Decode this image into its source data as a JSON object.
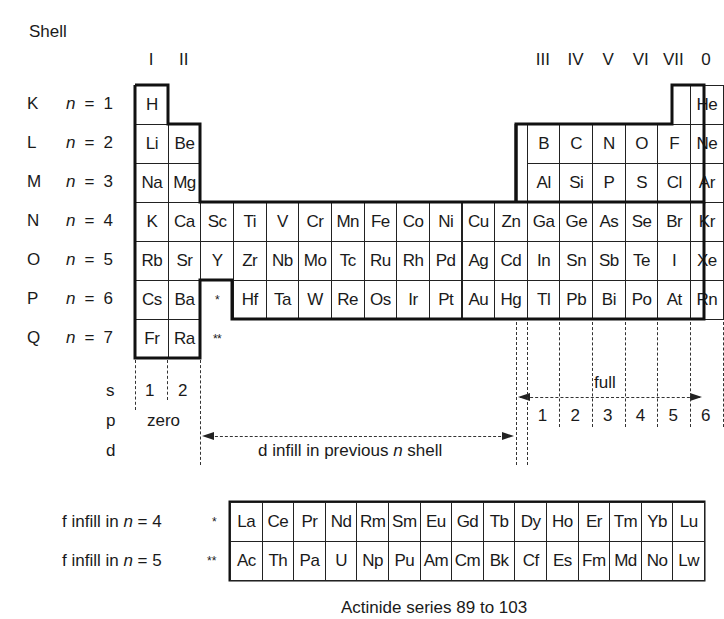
{
  "title": "Shell",
  "groups": [
    {
      "label": "I",
      "col": 0
    },
    {
      "label": "II",
      "col": 1
    },
    {
      "label": "III",
      "col": 12
    },
    {
      "label": "IV",
      "col": 13
    },
    {
      "label": "V",
      "col": 14
    },
    {
      "label": "VI",
      "col": 15
    },
    {
      "label": "VII",
      "col": 16
    },
    {
      "label": "0",
      "col": 17
    }
  ],
  "shells": [
    {
      "letter": "K",
      "n": "1"
    },
    {
      "letter": "L",
      "n": "2"
    },
    {
      "letter": "M",
      "n": "3"
    },
    {
      "letter": "N",
      "n": "4"
    },
    {
      "letter": "O",
      "n": "5"
    },
    {
      "letter": "P",
      "n": "6"
    },
    {
      "letter": "Q",
      "n": "7"
    }
  ],
  "n_prefix": "n",
  "n_equals": "=",
  "main_table": [
    [
      "H",
      "",
      "",
      "",
      "",
      "",
      "",
      "",
      "",
      "",
      "",
      "",
      "",
      "",
      "",
      "",
      "",
      "He"
    ],
    [
      "Li",
      "Be",
      "",
      "",
      "",
      "",
      "",
      "",
      "",
      "",
      "",
      "",
      "B",
      "C",
      "N",
      "O",
      "F",
      "Ne"
    ],
    [
      "Na",
      "Mg",
      "",
      "",
      "",
      "",
      "",
      "",
      "",
      "",
      "",
      "",
      "Al",
      "Si",
      "P",
      "S",
      "Cl",
      "Ar"
    ],
    [
      "K",
      "Ca",
      "Sc",
      "Ti",
      "V",
      "Cr",
      "Mn",
      "Fe",
      "Co",
      "Ni",
      "Cu",
      "Zn",
      "Ga",
      "Ge",
      "As",
      "Se",
      "Br",
      "Kr"
    ],
    [
      "Rb",
      "Sr",
      "Y",
      "Zr",
      "Nb",
      "Mo",
      "Tc",
      "Ru",
      "Rh",
      "Pd",
      "Ag",
      "Cd",
      "In",
      "Sn",
      "Sb",
      "Te",
      "I",
      "Xe"
    ],
    [
      "Cs",
      "Ba",
      "*",
      "Hf",
      "Ta",
      "W",
      "Re",
      "Os",
      "Ir",
      "Pt",
      "Au",
      "Hg",
      "Tl",
      "Pb",
      "Bi",
      "Po",
      "At",
      "Rn"
    ],
    [
      "Fr",
      "Ra",
      "**",
      "",
      "",
      "",
      "",
      "",
      "",
      "",
      "",
      "",
      "",
      "",
      "",
      "",
      "",
      ""
    ]
  ],
  "orbitals": {
    "s_label": "s",
    "p_label": "p",
    "d_label": "d",
    "s_numbers": [
      "1",
      "2"
    ],
    "s_zero": "zero",
    "d_text_pre": "d infill in previous ",
    "d_text_n": "n",
    "d_text_post": " shell",
    "p_full": "full",
    "p_numbers": [
      "1",
      "2",
      "3",
      "4",
      "5",
      "6"
    ]
  },
  "f_block": {
    "rows": [
      {
        "label_pre": "f infill in ",
        "label_n": "n",
        "label_post": " = 4",
        "marker": "*",
        "elements": [
          "La",
          "Ce",
          "Pr",
          "Nd",
          "Rm",
          "Sm",
          "Eu",
          "Gd",
          "Tb",
          "Dy",
          "Ho",
          "Er",
          "Tm",
          "Yb",
          "Lu"
        ]
      },
      {
        "label_pre": "f infill in ",
        "label_n": "n",
        "label_post": " = 5",
        "marker": "**",
        "elements": [
          "Ac",
          "Th",
          "Pa",
          "U",
          "Np",
          "Pu",
          "Am",
          "Cm",
          "Bk",
          "Cf",
          "Es",
          "Fm",
          "Md",
          "No",
          "Lw"
        ]
      }
    ],
    "caption": "Actinide series 89 to 103"
  },
  "colors": {
    "ink": "#1a1a1a",
    "background": "#ffffff"
  }
}
